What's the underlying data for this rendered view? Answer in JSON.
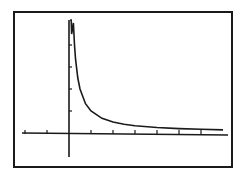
{
  "chart_data": {
    "type": "line",
    "title": "",
    "xlabel": "",
    "ylabel": "",
    "function": "y = 1/x",
    "xlim": [
      -2,
      7
    ],
    "ylim": [
      -1,
      5
    ],
    "grid": false,
    "legend": null,
    "x_ticks": [
      -2,
      -1,
      1,
      2,
      3,
      4,
      5,
      6
    ],
    "y_ticks": [
      1,
      2,
      3,
      4
    ],
    "series": [
      {
        "name": "y1",
        "x": [
          0.2,
          0.25,
          0.3,
          0.4,
          0.5,
          0.75,
          1,
          1.5,
          2,
          2.5,
          3,
          4,
          5,
          6,
          7
        ],
        "values": [
          5,
          4,
          3.33,
          2.5,
          2,
          1.33,
          1,
          0.67,
          0.5,
          0.4,
          0.33,
          0.25,
          0.2,
          0.17,
          0.14
        ]
      }
    ]
  },
  "colors": {
    "background": "#ffffff",
    "ink": "#1a1a1a"
  }
}
